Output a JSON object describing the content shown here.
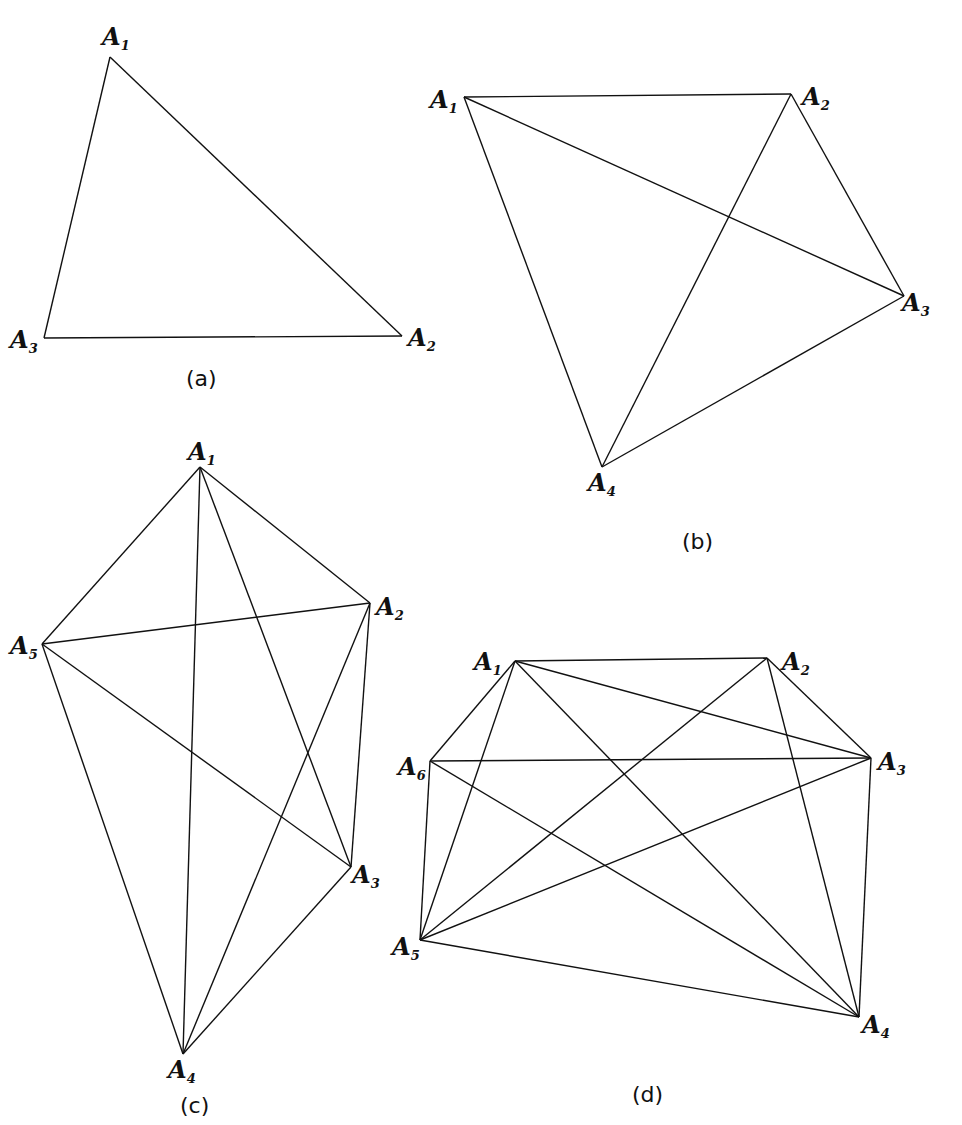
{
  "figures": [
    {
      "id": "a",
      "caption": "(a)",
      "caption_pos": [
        186,
        386
      ],
      "vertices": [
        {
          "name": "A",
          "sub": "1",
          "x": 110,
          "y": 57,
          "lx": 102,
          "ly": 45
        },
        {
          "name": "A",
          "sub": "2",
          "x": 402,
          "y": 336,
          "lx": 408,
          "ly": 346
        },
        {
          "name": "A",
          "sub": "3",
          "x": 44,
          "y": 338,
          "lx": 10,
          "ly": 348
        }
      ],
      "edges": [
        [
          0,
          1
        ],
        [
          1,
          2
        ],
        [
          2,
          0
        ]
      ]
    },
    {
      "id": "b",
      "caption": "(b)",
      "caption_pos": [
        682,
        549
      ],
      "vertices": [
        {
          "name": "A",
          "sub": "1",
          "x": 464,
          "y": 97,
          "lx": 430,
          "ly": 108
        },
        {
          "name": "A",
          "sub": "2",
          "x": 791,
          "y": 94,
          "lx": 802,
          "ly": 105
        },
        {
          "name": "A",
          "sub": "3",
          "x": 904,
          "y": 296,
          "lx": 902,
          "ly": 311
        },
        {
          "name": "A",
          "sub": "4",
          "x": 602,
          "y": 467,
          "lx": 588,
          "ly": 491
        }
      ],
      "edges": [
        [
          0,
          1
        ],
        [
          1,
          2
        ],
        [
          2,
          3
        ],
        [
          3,
          0
        ],
        [
          0,
          2
        ],
        [
          1,
          3
        ]
      ]
    },
    {
      "id": "c",
      "caption": "(c)",
      "caption_pos": [
        180,
        1113
      ],
      "vertices": [
        {
          "name": "A",
          "sub": "1",
          "x": 200,
          "y": 467,
          "lx": 188,
          "ly": 460
        },
        {
          "name": "A",
          "sub": "2",
          "x": 370,
          "y": 603,
          "lx": 376,
          "ly": 615
        },
        {
          "name": "A",
          "sub": "3",
          "x": 351,
          "y": 867,
          "lx": 352,
          "ly": 883
        },
        {
          "name": "A",
          "sub": "4",
          "x": 183,
          "y": 1054,
          "lx": 168,
          "ly": 1078
        },
        {
          "name": "A",
          "sub": "5",
          "x": 42,
          "y": 644,
          "lx": 10,
          "ly": 654
        }
      ],
      "edges": [
        [
          0,
          1
        ],
        [
          0,
          2
        ],
        [
          0,
          3
        ],
        [
          0,
          4
        ],
        [
          1,
          2
        ],
        [
          1,
          3
        ],
        [
          1,
          4
        ],
        [
          2,
          3
        ],
        [
          2,
          4
        ],
        [
          3,
          4
        ]
      ]
    },
    {
      "id": "d",
      "caption": "(d)",
      "caption_pos": [
        632,
        1102
      ],
      "vertices": [
        {
          "name": "A",
          "sub": "1",
          "x": 515,
          "y": 661,
          "lx": 474,
          "ly": 670
        },
        {
          "name": "A",
          "sub": "2",
          "x": 767,
          "y": 658,
          "lx": 782,
          "ly": 670
        },
        {
          "name": "A",
          "sub": "3",
          "x": 871,
          "y": 758,
          "lx": 878,
          "ly": 770
        },
        {
          "name": "A",
          "sub": "4",
          "x": 859,
          "y": 1017,
          "lx": 862,
          "ly": 1033
        },
        {
          "name": "A",
          "sub": "5",
          "x": 420,
          "y": 940,
          "lx": 392,
          "ly": 955
        },
        {
          "name": "A",
          "sub": "6",
          "x": 430,
          "y": 761,
          "lx": 398,
          "ly": 775
        }
      ],
      "edges": [
        [
          0,
          1
        ],
        [
          0,
          5
        ],
        [
          0,
          4
        ],
        [
          0,
          3
        ],
        [
          0,
          2
        ],
        [
          1,
          2
        ],
        [
          1,
          3
        ],
        [
          1,
          4
        ],
        [
          5,
          2
        ],
        [
          5,
          4
        ],
        [
          5,
          3
        ],
        [
          4,
          2
        ],
        [
          4,
          3
        ],
        [
          2,
          3
        ]
      ]
    }
  ]
}
